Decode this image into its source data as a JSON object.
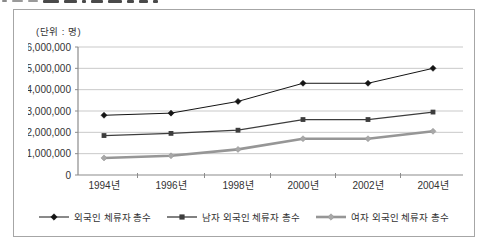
{
  "page": {
    "unit_label": "(단위 : 명)"
  },
  "colors": {
    "background": "#ffffff",
    "panel_border": "#a6a6a6",
    "gridline": "#c9c9c9",
    "axis": "#8c8c8c",
    "text": "#333333"
  },
  "chart_data": {
    "type": "line",
    "title": "",
    "xlabel": "",
    "ylabel": "(단위 : 명)",
    "ylim": [
      0,
      6000000
    ],
    "ytick_step": 1000000,
    "ytick_labels": [
      "0",
      "1,000,000",
      "2,000,000",
      "3,000,000",
      "4,000,000",
      "5,000,000",
      "6,000,000"
    ],
    "grid": true,
    "legend_position": "bottom",
    "categories": [
      "1994년",
      "1996년",
      "1998년",
      "2000년",
      "2002년",
      "2004년"
    ],
    "series": [
      {
        "name": "외국인 체류자 총수",
        "values": [
          2800000,
          2900000,
          3450000,
          4300000,
          4300000,
          5000000
        ],
        "color": "#141414",
        "marker": "diamond",
        "marker_fill": "#141414",
        "line_width": 1
      },
      {
        "name": "남자 외국인 체류자 총수",
        "values": [
          1850000,
          1950000,
          2100000,
          2600000,
          2600000,
          2950000
        ],
        "color": "#3d3d3d",
        "marker": "square",
        "marker_fill": "#3d3d3d",
        "line_width": 1.3
      },
      {
        "name": "여자 외국인 체류자 총수",
        "values": [
          800000,
          900000,
          1200000,
          1700000,
          1700000,
          2050000
        ],
        "color": "#969696",
        "marker": "diamond",
        "marker_fill": "#a8a8a8",
        "line_width": 2.6
      }
    ]
  }
}
